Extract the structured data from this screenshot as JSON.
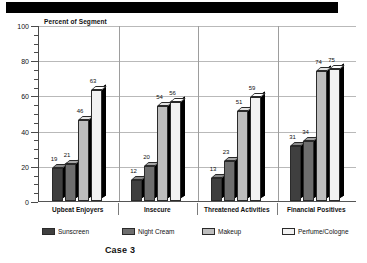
{
  "banner": {
    "present": true
  },
  "caption": {
    "text": "Case 3"
  },
  "chart_data": {
    "type": "bar",
    "title": "",
    "axis_title": "Percent of Segment",
    "xlabel": "",
    "ylabel": "Percent of Segment",
    "ylim": [
      0,
      100
    ],
    "ytick_labels": [
      "0",
      "20",
      "40",
      "60",
      "80",
      "100"
    ],
    "ytick_values": [
      0,
      20,
      40,
      60,
      80,
      100
    ],
    "minor_tick_step": 5,
    "grid": true,
    "legend_position": "bottom",
    "categories": [
      "Upbeat Enjoyers",
      "Insecure",
      "Threatened Activities",
      "Financial Positives"
    ],
    "series": [
      {
        "name": "Sunscreen",
        "color": "#3f3f3f",
        "values": [
          19,
          12,
          13,
          31
        ]
      },
      {
        "name": "Night Cream",
        "color": "#6e6e6e",
        "values": [
          21,
          20,
          23,
          34
        ]
      },
      {
        "name": "Makeup",
        "color": "#bdbdbd",
        "values": [
          46,
          54,
          51,
          74
        ]
      },
      {
        "name": "Perfume/Cologne",
        "color": "#f2f2f2",
        "values": [
          63,
          56,
          59,
          75
        ]
      }
    ]
  }
}
